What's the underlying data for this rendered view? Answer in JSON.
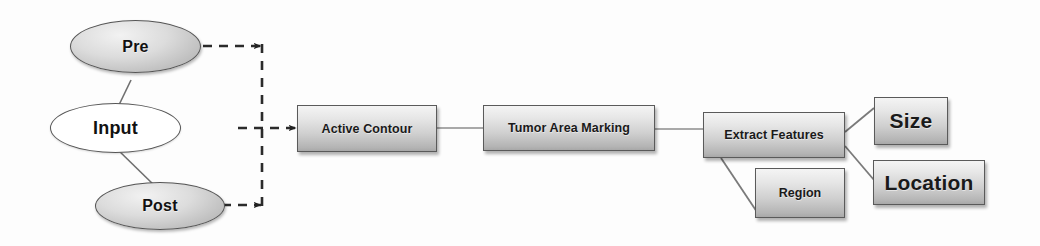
{
  "diagram": {
    "background_color": "#fdfdfd",
    "nodes": {
      "input": {
        "label": "Input",
        "shape": "ellipse",
        "fill": "white"
      },
      "pre": {
        "label": "Pre",
        "shape": "ellipse",
        "fill": "gray-gradient"
      },
      "post": {
        "label": "Post",
        "shape": "ellipse",
        "fill": "gray-gradient"
      },
      "active_contour": {
        "label": "Active Contour",
        "shape": "rect",
        "fill": "gray-gradient"
      },
      "tumor_marking": {
        "label": "Tumor Area Marking",
        "shape": "rect",
        "fill": "gray-gradient"
      },
      "extract_features": {
        "label": "Extract Features",
        "shape": "rect",
        "fill": "gray-gradient"
      },
      "size": {
        "label": "Size",
        "shape": "rect",
        "fill": "gray-gradient"
      },
      "location": {
        "label": "Location",
        "shape": "rect",
        "fill": "gray-gradient"
      },
      "region": {
        "label": "Region",
        "shape": "rect",
        "fill": "gray-gradient"
      }
    },
    "edges": [
      {
        "from": "input",
        "to": "pre",
        "style": "solid"
      },
      {
        "from": "input",
        "to": "post",
        "style": "solid"
      },
      {
        "from": "pre",
        "to": "bus",
        "style": "dashed",
        "arrow": true
      },
      {
        "from": "post",
        "to": "bus",
        "style": "dashed",
        "arrow": true
      },
      {
        "from": "bus",
        "to": "active_contour",
        "style": "dashed",
        "arrow": true
      },
      {
        "from": "active_contour",
        "to": "tumor_marking",
        "style": "solid"
      },
      {
        "from": "tumor_marking",
        "to": "extract_features",
        "style": "solid"
      },
      {
        "from": "extract_features",
        "to": "size",
        "style": "solid"
      },
      {
        "from": "extract_features",
        "to": "location",
        "style": "solid"
      },
      {
        "from": "extract_features",
        "to": "region",
        "style": "solid"
      }
    ],
    "colors": {
      "edge": "#6f6f6f",
      "dashed_edge": "#2b2b2b",
      "node_border": "#5a5a5a",
      "text": "#1a1a1a"
    }
  }
}
